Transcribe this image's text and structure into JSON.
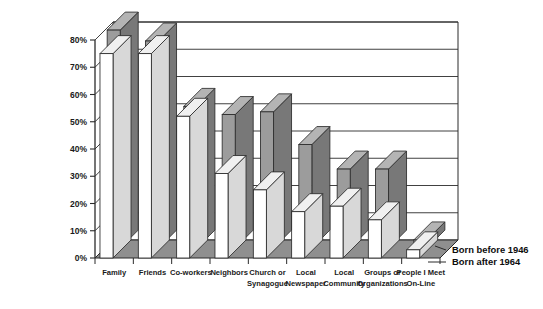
{
  "chart_data": {
    "type": "bar",
    "title": "",
    "subtitle": "",
    "xlabel": "",
    "ylabel": "",
    "ylim": [
      0,
      80
    ],
    "grid": true,
    "legend_position": "right-bottom",
    "three_d": true,
    "categories": [
      "Family",
      "Friends",
      "Co-workers",
      "Neighbors",
      "Church or Synagogue",
      "Local Newspaper",
      "Local Community",
      "Groups or Organizations",
      "People I Meet On-Line"
    ],
    "category_lines": [
      [
        "Family"
      ],
      [
        "Friends"
      ],
      [
        "Co-workers"
      ],
      [
        "Neighbors"
      ],
      [
        "Church or",
        "Synagogue"
      ],
      [
        "Local",
        "Newspaper"
      ],
      [
        "Local",
        "Community"
      ],
      [
        "Groups or",
        "Organizations"
      ],
      [
        "People I Meet",
        "On-Line"
      ]
    ],
    "series": [
      {
        "name": "Born after 1964",
        "color": "#ffffff",
        "values": [
          75,
          75,
          52,
          31,
          25,
          17,
          19,
          14,
          3
        ]
      },
      {
        "name": "Born before 1946",
        "color": "#9c9c9c",
        "values": [
          80,
          76,
          52,
          49,
          50,
          38,
          29,
          29,
          3
        ]
      }
    ],
    "tick_labels": [
      "0%",
      "10%",
      "20%",
      "30%",
      "40%",
      "50%",
      "60%",
      "70%",
      "80%"
    ],
    "tick_values": [
      0,
      10,
      20,
      30,
      40,
      50,
      60,
      70,
      80
    ]
  },
  "legend": {
    "entries": [
      {
        "label": "Born before 1946",
        "swatch": "#9c9c9c"
      },
      {
        "label": "Born after 1964",
        "swatch": "#ffffff"
      }
    ]
  },
  "colors": {
    "bar_front_light": "#ffffff",
    "bar_side_light": "#d8d8d8",
    "bar_top_light": "#f0f0f0",
    "bar_front_dark": "#9c9c9c",
    "bar_side_dark": "#787878",
    "bar_top_dark": "#b4b4b4",
    "floor": "#8f8f8f",
    "wall": "#ffffff",
    "line": "#2b2b2b",
    "text": "#151515"
  }
}
